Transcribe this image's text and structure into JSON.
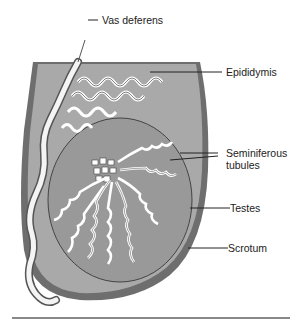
{
  "diagram": {
    "labels": {
      "vas_deferens": "Vas deferens",
      "epididymis": "Epididymis",
      "seminiferous_line1": "Seminiferous",
      "seminiferous_line2": "tubules",
      "testes": "Testes",
      "scrotum": "Scrotum"
    },
    "colors": {
      "scrotum_outer": "#6e6e6e",
      "scrotum_fill": "#a7a7a7",
      "testis_fill": "#9a9a9a",
      "tubule_fill": "#ffffff",
      "tubule_stroke": "#3a3a3a",
      "leader_line": "#222222",
      "rule": "#888888"
    }
  }
}
